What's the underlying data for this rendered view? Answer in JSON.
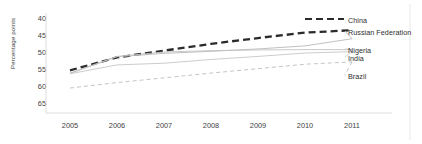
{
  "chart_data": {
    "type": "line",
    "title": "",
    "xlabel": "",
    "ylabel": "Percentage points",
    "x": [
      2005,
      2006,
      2007,
      2008,
      2009,
      2010,
      2011
    ],
    "xlim": [
      2004.7,
      2011.6
    ],
    "ylim": [
      65,
      40
    ],
    "y_axis_inverted": true,
    "yticks": [
      40,
      45,
      50,
      55,
      60,
      65
    ],
    "xticks": [
      "2005",
      "2006",
      "2007",
      "2008",
      "2009",
      "2010",
      "2011"
    ],
    "grid": false,
    "legend_position": "right-of-plot-at-line-ends",
    "series": [
      {
        "name": "China",
        "values": [
          55.4,
          51.6,
          49.6,
          47.6,
          45.9,
          44.3,
          43.6
        ],
        "color": "#2b2b2b",
        "style": "dashed",
        "width": 2.3
      },
      {
        "name": "Russian Federation",
        "values": [
          56.3,
          51.4,
          50.4,
          49.8,
          49.1,
          48.2,
          46.1
        ],
        "color": "#b9b9b9",
        "style": "solid",
        "width": 0.9
      },
      {
        "name": "Nigeria",
        "values": [
          56.2,
          51.3,
          50.0,
          49.6,
          49.4,
          49.3,
          49.3
        ],
        "color": "#c2c2c2",
        "style": "solid",
        "width": 0.9
      },
      {
        "name": "India",
        "values": [
          56.4,
          53.8,
          53.3,
          52.2,
          51.3,
          50.3,
          49.9
        ],
        "color": "#c6c6c6",
        "style": "solid",
        "width": 0.9
      },
      {
        "name": "Brazil",
        "values": [
          60.6,
          59.0,
          57.6,
          56.2,
          54.9,
          53.6,
          52.9
        ],
        "color": "#bdbdbd",
        "style": "dashed",
        "width": 0.9
      }
    ],
    "legend_entries": [
      {
        "label": "China",
        "has_line_sample": true
      },
      {
        "label": "Russian Federation",
        "has_line_sample": false
      },
      {
        "label": "Nigeria",
        "has_line_sample": false
      },
      {
        "label": "India",
        "has_line_sample": false
      },
      {
        "label": "Brazil",
        "has_line_sample": false
      }
    ]
  },
  "axis": {
    "ylabel": "Percentage points",
    "yticks": [
      "40",
      "45",
      "50",
      "55",
      "60",
      "65"
    ],
    "xticks": [
      "2005",
      "2006",
      "2007",
      "2008",
      "2009",
      "2010",
      "2011"
    ]
  },
  "legend": {
    "items": [
      "China",
      "Russian Federation",
      "Nigeria",
      "India",
      "Brazil"
    ]
  },
  "colors": {
    "china": "#2b2b2b",
    "others": "#c0c0c0",
    "axis": "#d0d0d0",
    "text": "#333333"
  }
}
